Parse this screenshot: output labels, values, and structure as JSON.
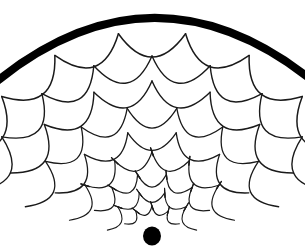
{
  "figure": {
    "canvas": {
      "width": 305,
      "height": 247,
      "background": "#ffffff"
    },
    "ink_color": "#1a1a1a",
    "rim_color": "#000000",
    "dot_color": "#000000"
  },
  "geometry": {
    "focus": {
      "x": 152,
      "y": 236
    },
    "rim": {
      "name": "outer-rim-arc",
      "apex": {
        "x": 152,
        "y": 10
      },
      "left_end": {
        "x": -4,
        "y": 82
      },
      "right_end": {
        "x": 309,
        "y": 78
      },
      "stroke_width": 8
    },
    "dot": {
      "cx": 152,
      "cy": 236,
      "rx": 9,
      "ry": 9.5
    },
    "fan": {
      "half_angle_deg": 66,
      "rows": 9
    }
  },
  "chart_data": {
    "type": "scatter",
    "rows": [
      {
        "index": 1,
        "radius": 205,
        "scale_count": 7,
        "stroke_width": 1.5,
        "ticks": false,
        "arc_depth": 26
      },
      {
        "index": 2,
        "radius": 180,
        "scale_count": 7,
        "stroke_width": 1.4,
        "ticks": false,
        "arc_depth": 25
      },
      {
        "index": 3,
        "radius": 155,
        "scale_count": 6,
        "stroke_width": 1.4,
        "ticks": false,
        "arc_depth": 24
      },
      {
        "index": 4,
        "radius": 130,
        "scale_count": 6,
        "stroke_width": 1.3,
        "ticks": false,
        "arc_depth": 22
      },
      {
        "index": 5,
        "radius": 106,
        "scale_count": 5,
        "stroke_width": 1.3,
        "ticks": false,
        "arc_depth": 20
      },
      {
        "index": 6,
        "radius": 84,
        "scale_count": 5,
        "stroke_width": 1.2,
        "ticks": true,
        "arc_depth": 17
      },
      {
        "index": 7,
        "radius": 63,
        "scale_count": 5,
        "stroke_width": 1.2,
        "ticks": true,
        "arc_depth": 14
      },
      {
        "index": 8,
        "radius": 45,
        "scale_count": 4,
        "stroke_width": 1.1,
        "ticks": true,
        "arc_depth": 11
      },
      {
        "index": 9,
        "radius": 30,
        "scale_count": 4,
        "stroke_width": 1.1,
        "ticks": true,
        "arc_depth": 8
      }
    ]
  }
}
